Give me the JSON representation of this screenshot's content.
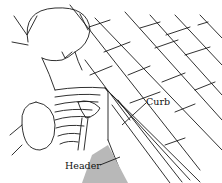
{
  "illustration": {
    "subject": "Person installing skylight curb on shingled roof",
    "labels": {
      "curb": "Curb",
      "header": "Header"
    },
    "colors": {
      "line": "#1a1a1a",
      "header_fill": "#b8b8b8",
      "background": "#ffffff"
    }
  }
}
